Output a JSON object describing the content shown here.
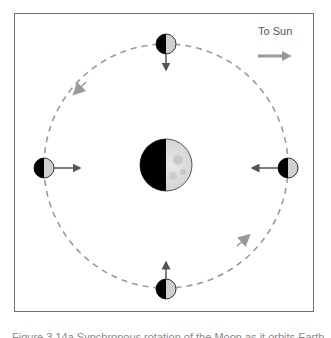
{
  "diagram": {
    "title": "Synchronous rotation of the Moon",
    "sun_direction_label": "To Sun",
    "center_body": "Earth",
    "orbit_style": "dashed",
    "orbit_direction": "counterclockwise",
    "moon_positions": [
      {
        "position": "top",
        "arrow_direction": "down (toward Earth)"
      },
      {
        "position": "left",
        "arrow_direction": "right (toward Earth)"
      },
      {
        "position": "right",
        "arrow_direction": "left (toward Earth)"
      },
      {
        "position": "bottom",
        "arrow_direction": "up (toward Earth)"
      }
    ],
    "colors": {
      "frame": "#6e6e6e",
      "orbit": "#9a9a9a",
      "dark_side": "#000000",
      "lit_side": "#cfcfcf",
      "arrow": "#555555",
      "sun_arrow": "#999999"
    }
  },
  "caption": {
    "text": "Figure 3.14a Synchronous rotation of the Moon as it orbits Earth"
  }
}
